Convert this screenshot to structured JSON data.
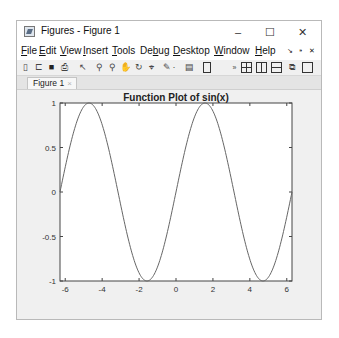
{
  "window": {
    "title": "Figures - Figure 1",
    "controls": {
      "minimize": "–",
      "maximize": "☐",
      "close": "✕"
    }
  },
  "menubar": {
    "items": [
      {
        "label": "File",
        "mnemonic": "F"
      },
      {
        "label": "Edit",
        "mnemonic": "E"
      },
      {
        "label": "View",
        "mnemonic": "V"
      },
      {
        "label": "Insert",
        "mnemonic": "I"
      },
      {
        "label": "Tools",
        "mnemonic": "T"
      },
      {
        "label": "Debug",
        "mnemonic": "b"
      },
      {
        "label": "Desktop",
        "mnemonic": "D"
      },
      {
        "label": "Window",
        "mnemonic": "W"
      },
      {
        "label": "Help",
        "mnemonic": "H"
      }
    ],
    "right_icons": [
      "undock-arrow-icon",
      "pin-icon",
      "close-icon"
    ]
  },
  "toolbar": {
    "icons": [
      "new-figure-icon",
      "open-file-icon",
      "save-icon",
      "print-icon",
      "select-pointer-icon",
      "zoom-in-icon",
      "zoom-out-icon",
      "pan-icon",
      "rotate-3d-icon",
      "data-cursor-icon",
      "brush-icon",
      "brush-dropdown-icon",
      "link-plot-icon",
      "colorbar-icon",
      "overflow-icon",
      "tile-grid-icon",
      "split-left-right-icon",
      "split-top-bottom-icon",
      "float-icon",
      "maximize-icon"
    ]
  },
  "tabs": [
    {
      "label": "Figure 1",
      "close": "×"
    }
  ],
  "chart_data": {
    "type": "line",
    "title": "Function Plot of sin(x)",
    "xlabel": "",
    "ylabel": "",
    "xlim": [
      -6.2832,
      6.2832
    ],
    "ylim": [
      -1,
      1
    ],
    "xticks": [
      -6,
      -4,
      -2,
      0,
      2,
      4,
      6
    ],
    "yticks": [
      -1,
      -0.5,
      0,
      0.5,
      1
    ],
    "xtick_labels": [
      "-6",
      "-4",
      "-2",
      "0",
      "2",
      "4",
      "6"
    ],
    "ytick_labels": [
      "-1",
      "-0.5",
      "0",
      "0.5",
      "1"
    ],
    "grid": false,
    "legend": null,
    "series": [
      {
        "name": "sin(x)",
        "function": "sin(x)",
        "color": "#666666",
        "x": [
          -6.2832,
          -5.4978,
          -4.7124,
          -3.927,
          -3.1416,
          -2.3562,
          -1.5708,
          -0.7854,
          0,
          0.7854,
          1.5708,
          2.3562,
          3.1416,
          3.927,
          4.7124,
          5.4978,
          6.2832
        ],
        "y": [
          0,
          0.7071,
          1,
          0.7071,
          0,
          -0.7071,
          -1,
          -0.7071,
          0,
          0.7071,
          1,
          0.7071,
          0,
          -0.7071,
          -1,
          -0.7071,
          0
        ]
      }
    ]
  }
}
